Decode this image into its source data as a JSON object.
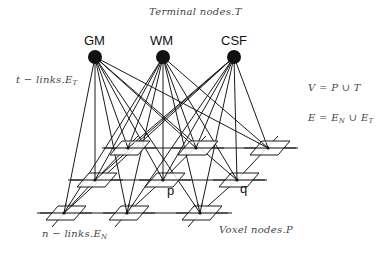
{
  "labels": {
    "terminal_title": "Terminal nodes.T",
    "t_links_prefix": "t − links.E",
    "t_links_sub": "T",
    "n_links_prefix": "n − links.E",
    "n_links_sub": "N",
    "voxel_nodes": "Voxel nodes.P",
    "eq_v": "V = P ∪ T",
    "eq_e_prefix": "E = E",
    "eq_e_sub1": "N",
    "eq_e_mid": " ∪ E",
    "eq_e_sub2": "T",
    "node_p": "p",
    "node_q": "q"
  },
  "terminal_nodes": [
    {
      "label": "GM",
      "x": 95,
      "y": 57
    },
    {
      "label": "WM",
      "x": 163,
      "y": 57
    },
    {
      "label": "CSF",
      "x": 234,
      "y": 57
    }
  ],
  "voxel_rows": [
    {
      "row": "back",
      "y": 148,
      "xs": [
        128,
        196,
        268
      ],
      "line": [
        102,
        298
      ]
    },
    {
      "row": "middle",
      "y": 180,
      "xs": [
        95,
        163,
        237
      ],
      "line": [
        68,
        267
      ]
    },
    {
      "row": "front",
      "y": 213,
      "xs": [
        64,
        127,
        200
      ],
      "line": [
        37,
        232
      ]
    }
  ],
  "colors": {
    "line": "#1a1a1a",
    "node_fill": "#111111",
    "plane_fill": "#ffffff"
  }
}
